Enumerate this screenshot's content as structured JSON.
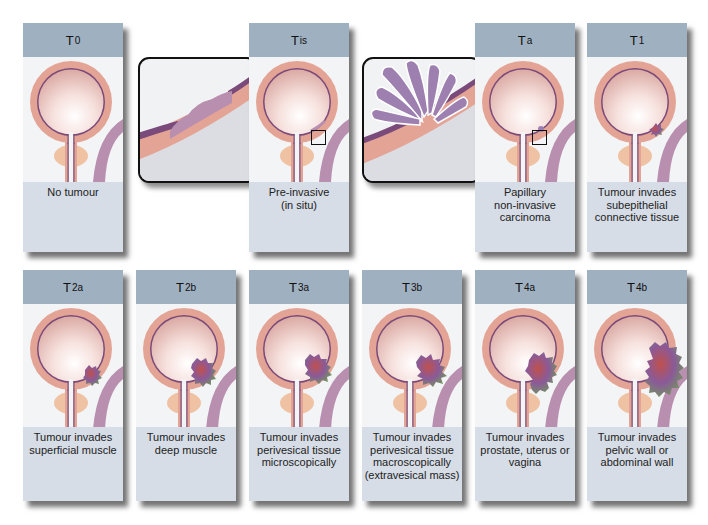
{
  "colors": {
    "header": "#9fb0c0",
    "caption": "#d6dde6",
    "bladder_wall": "#e3a496",
    "bladder_lining": "#7a4a7a",
    "bladder_interior": "#f6d9d4",
    "prostate": "#f0c2a4",
    "pelvic_band": "#b98fb0",
    "tumour_green": "#6f9e55",
    "tumour_purple": "#8a5a99",
    "tumour_red": "#c0504d"
  },
  "stages": [
    {
      "id": "T0",
      "main": "T",
      "sub": "0",
      "caption": [
        "No tumour"
      ]
    },
    {
      "id": "Tis",
      "main": "T",
      "sub": "is",
      "caption": [
        "Pre-invasive",
        "(in situ)"
      ]
    },
    {
      "id": "Ta",
      "main": "T",
      "sub": "a",
      "caption": [
        "Papillary",
        "non-invasive",
        "carcinoma"
      ]
    },
    {
      "id": "T1",
      "main": "T",
      "sub": "1",
      "caption": [
        "Tumour invades",
        "subepithelial",
        "connective tissue"
      ]
    },
    {
      "id": "T2a",
      "main": "T",
      "sub": "2a",
      "caption": [
        "Tumour invades",
        "superficial muscle"
      ]
    },
    {
      "id": "T2b",
      "main": "T",
      "sub": "2b",
      "caption": [
        "Tumour invades",
        "deep muscle"
      ]
    },
    {
      "id": "T3a",
      "main": "T",
      "sub": "3a",
      "caption": [
        "Tumour invades",
        "perivesical tissue",
        "microscopically"
      ]
    },
    {
      "id": "T3b",
      "main": "T",
      "sub": "3b",
      "caption": [
        "Tumour invades",
        "perivesical tissue",
        "macroscopically",
        "(extravesical mass)"
      ]
    },
    {
      "id": "T4a",
      "main": "T",
      "sub": "4a",
      "caption": [
        "Tumour invades",
        "prostate, uterus or",
        "vagina"
      ]
    },
    {
      "id": "T4b",
      "main": "T",
      "sub": "4b",
      "caption": [
        "Tumour invades",
        "pelvic wall or",
        "abdominal wall"
      ]
    }
  ],
  "callouts": [
    {
      "for": "Tis",
      "depicts": "flat carcinoma in situ within urothelium"
    },
    {
      "for": "Ta",
      "depicts": "papillary frond projecting from urothelium"
    }
  ]
}
